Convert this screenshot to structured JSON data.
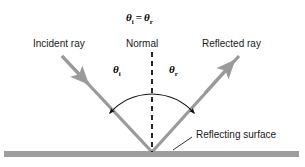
{
  "figure": {
    "background_color": "#ffffff",
    "ray_color": "#9a9a9a",
    "surface_color": "#9e9e9e",
    "normal_color": "#111111",
    "arc_color": "#111111",
    "text_color": "#1a1a1a"
  },
  "equation": {
    "theta": "θ",
    "sub_incident": "i",
    "equals": "=",
    "sub_reflected": "r"
  },
  "labels": {
    "incident_ray": "Incident ray",
    "normal": "Normal",
    "reflected_ray": "Reflected ray",
    "reflecting_surface": "Reflecting surface",
    "angle_incidence_symbol": "θ",
    "angle_incidence_sub": "i",
    "angle_reflection_symbol": "θ",
    "angle_reflection_sub": "r"
  },
  "geometry": {
    "vertex_x": 152,
    "vertex_y": 152,
    "incident_start_x": 62,
    "incident_start_y": 56,
    "reflected_end_x": 239,
    "reflected_end_y": 56,
    "normal_top_y": 52,
    "surface_y": 154,
    "surface_left_x": 4,
    "surface_right_x": 299,
    "surface_thickness": 6,
    "arc_radius": 58
  }
}
